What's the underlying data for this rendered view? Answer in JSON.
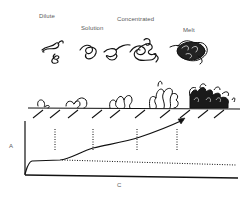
{
  "regime_labels": {
    "dilute": "Dilute",
    "solution": "Solution",
    "concentrated": "Concentrated",
    "melt": "Melt"
  },
  "axes": {
    "y_label": "A",
    "x_label": "C"
  },
  "colors": {
    "ink": "#111111",
    "label": "#5a5a5a",
    "background": "#ffffff"
  }
}
